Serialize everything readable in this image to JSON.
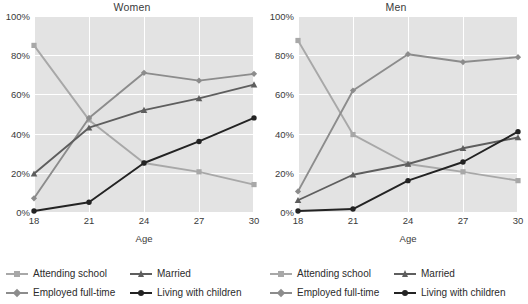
{
  "chart_data": [
    {
      "type": "line",
      "title": "Women",
      "xlabel": "Age",
      "ylabel": "",
      "categories": [
        "18",
        "21",
        "24",
        "27",
        "30"
      ],
      "x": [
        18,
        21,
        24,
        27,
        30
      ],
      "xlim": [
        18,
        30
      ],
      "ylim": [
        0,
        100
      ],
      "yticks": [
        "0%",
        "20%",
        "40%",
        "60%",
        "80%",
        "100%"
      ],
      "ytick_values": [
        0,
        20,
        40,
        60,
        80,
        100
      ],
      "grid": true,
      "legend_position": "bottom",
      "series": [
        {
          "name": "Attending school",
          "values": [
            85,
            47,
            25,
            20.5,
            14
          ],
          "color": "#a8a8a8",
          "marker": "square"
        },
        {
          "name": "Employed full-time",
          "values": [
            7,
            48,
            71,
            67,
            70.5
          ],
          "color": "#8c8c8c",
          "marker": "diamond"
        },
        {
          "name": "Married",
          "values": [
            19.5,
            43,
            52,
            58,
            65
          ],
          "color": "#5e5e5e",
          "marker": "triangle"
        },
        {
          "name": "Living with children",
          "values": [
            0.5,
            5,
            25,
            36,
            48
          ],
          "color": "#232323",
          "marker": "circle"
        }
      ]
    },
    {
      "type": "line",
      "title": "Men",
      "xlabel": "Age",
      "ylabel": "",
      "categories": [
        "18",
        "21",
        "24",
        "27",
        "30"
      ],
      "x": [
        18,
        21,
        24,
        27,
        30
      ],
      "xlim": [
        18,
        30
      ],
      "ylim": [
        0,
        100
      ],
      "yticks": [
        "0%",
        "20%",
        "40%",
        "60%",
        "80%",
        "100%"
      ],
      "ytick_values": [
        0,
        20,
        40,
        60,
        80,
        100
      ],
      "grid": true,
      "legend_position": "bottom",
      "series": [
        {
          "name": "Attending school",
          "values": [
            87.5,
            39.5,
            24.5,
            20.5,
            16
          ],
          "color": "#a8a8a8",
          "marker": "square"
        },
        {
          "name": "Employed full-time",
          "values": [
            10.5,
            62,
            80.5,
            76.5,
            79
          ],
          "color": "#8c8c8c",
          "marker": "diamond"
        },
        {
          "name": "Married",
          "values": [
            6,
            19,
            24.5,
            32.5,
            38
          ],
          "color": "#5e5e5e",
          "marker": "triangle"
        },
        {
          "name": "Living with children",
          "values": [
            0.5,
            1.5,
            16,
            25.5,
            41
          ],
          "color": "#232323",
          "marker": "circle"
        }
      ]
    }
  ],
  "panels": [
    {
      "title": "Women",
      "xlabel": "Age",
      "yticks": [
        "100%",
        "80%",
        "60%",
        "40%",
        "20%",
        "0%"
      ],
      "xticks": [
        "18",
        "21",
        "24",
        "27",
        "30"
      ],
      "legend": [
        {
          "label": "Attending school",
          "color": "#a8a8a8",
          "marker": "square"
        },
        {
          "label": "Married",
          "color": "#5e5e5e",
          "marker": "triangle"
        },
        {
          "label": "Employed full-time",
          "color": "#8c8c8c",
          "marker": "diamond"
        },
        {
          "label": "Living with children",
          "color": "#232323",
          "marker": "circle"
        }
      ]
    },
    {
      "title": "Men",
      "xlabel": "Age",
      "yticks": [
        "100%",
        "80%",
        "60%",
        "40%",
        "20%",
        "0%"
      ],
      "xticks": [
        "18",
        "21",
        "24",
        "27",
        "30"
      ],
      "legend": [
        {
          "label": "Attending school",
          "color": "#a8a8a8",
          "marker": "square"
        },
        {
          "label": "Married",
          "color": "#5e5e5e",
          "marker": "triangle"
        },
        {
          "label": "Employed full-time",
          "color": "#8c8c8c",
          "marker": "diamond"
        },
        {
          "label": "Living with children",
          "color": "#232323",
          "marker": "circle"
        }
      ]
    }
  ],
  "colors": {
    "plot_background": "#e3e3e3",
    "gridline": "#ffffff",
    "page_background": "#ffffff",
    "text": "#3a3a3a"
  }
}
